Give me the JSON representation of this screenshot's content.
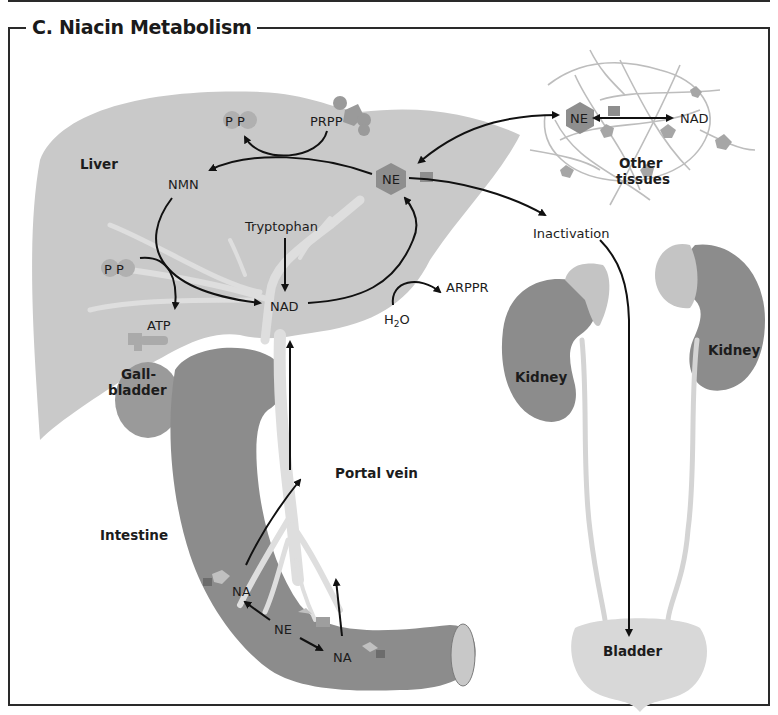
{
  "title": "C. Niacin Metabolism",
  "colors": {
    "liver": "#c9c9c9",
    "organ_dark": "#8c8c8c",
    "vessel": "#dedede",
    "adrenal": "#c4c4c4",
    "bladder": "#d8d8d8",
    "molecule_ne": "#8e8e8e",
    "phosphate": "#b0b0b0",
    "arrow": "#111111",
    "frame": "#2a2a2a"
  },
  "organs": {
    "liver": "Liver",
    "gallbladder_line1": "Gall-",
    "gallbladder_line2": "bladder",
    "intestine": "Intestine",
    "portal_vein": "Portal vein",
    "other_tissues_line1": "Other",
    "other_tissues_line2": "tissues",
    "kidney_left": "Kidney",
    "kidney_right": "Kidney",
    "bladder": "Bladder"
  },
  "molecules": {
    "pp_top": "P P",
    "prpp": "PRPP",
    "nmn": "NMN",
    "ne_liver": "NE",
    "tryptophan": "Tryptophan",
    "pp_left": "P P",
    "atp": "ATP",
    "nad_liver": "NAD",
    "h2o_h": "H",
    "h2o_sub": "2",
    "h2o_o": "O",
    "arppr": "ARPPR",
    "inactivation": "Inactivation",
    "ne_tissue": "NE",
    "nad_tissue": "NAD",
    "na_left": "NA",
    "ne_intestine": "NE",
    "na_right": "NA"
  }
}
